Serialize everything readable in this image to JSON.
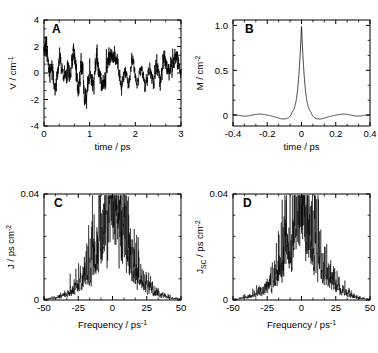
{
  "figure": {
    "background": "#ffffff",
    "line_color": "#000000",
    "panels": [
      "A",
      "B",
      "C",
      "D"
    ]
  },
  "chart_data": [
    {
      "type": "line",
      "panel": "A",
      "title": "",
      "label": "A",
      "xlabel": "time / ps",
      "ylabel": "V / cm-1",
      "ylabel_base": "V / cm",
      "ylabel_exp": "-1",
      "xlim": [
        0,
        3
      ],
      "ylim": [
        -4,
        4
      ],
      "xticks": [
        0,
        1,
        2,
        3
      ],
      "xticklabels": [
        "0",
        "1",
        "2",
        "3"
      ],
      "yticks": [
        -4,
        -2,
        0,
        2,
        4
      ],
      "yticklabels": [
        "-4",
        "-2",
        "0",
        "2",
        "4"
      ],
      "xminor_per_interval": 2,
      "yminor_per_interval": 2,
      "grid": false,
      "description": "Fluctuating solvent energy gap trajectory, high-frequency noise oscillating about zero, amplitude roughly -3.3 to 3.2 cm-1",
      "seed": 17,
      "n_points": 1500,
      "amplitude": 1.15,
      "series": [
        {
          "name": "V(t)",
          "envelope_note": "quasi-stationary noise, occasional excursions to +/-3"
        }
      ]
    },
    {
      "type": "line",
      "panel": "B",
      "label": "B",
      "xlabel": "time / ps",
      "ylabel": "M / cm-2",
      "ylabel_base": "M / cm",
      "ylabel_exp": "-2",
      "xlim": [
        -0.4,
        0.4
      ],
      "ylim": [
        -0.12,
        1.06
      ],
      "xticks": [
        -0.4,
        -0.2,
        0,
        0.2,
        0.4
      ],
      "xticklabels": [
        "-0.4",
        "-0.2",
        "0",
        "0.2",
        "0.4"
      ],
      "yticks": [
        0,
        0.5,
        1.0
      ],
      "yticklabels": [
        "0",
        "0.5",
        "1.0"
      ],
      "xminor_per_interval": 2,
      "yminor_per_interval": 2,
      "grid": false,
      "description": "Normalized autocorrelation function: sharp cusp peak of height 1.0 at t = 0, decaying with small negative sidelobes near -0.2 and 0.2 ps",
      "peak_value": 1.0,
      "peak_position": 0.0,
      "peak_halfwidth_ps": 0.022,
      "sidelobe_minima": [
        -0.22,
        0.2
      ],
      "sidelobe_depth": -0.06
    },
    {
      "type": "line",
      "panel": "C",
      "label": "C",
      "xlabel": "Frequency / ps-1",
      "xlabel_base": "Frequency / ps",
      "xlabel_exp": "-1",
      "ylabel": "J / ps cm-2",
      "ylabel_base": "J / ps cm",
      "ylabel_exp": "-2",
      "xlim": [
        -50,
        50
      ],
      "ylim": [
        0,
        0.04
      ],
      "xticks": [
        -50,
        -25,
        0,
        25,
        50
      ],
      "xticklabels": [
        "-50",
        "-25",
        "0",
        "25",
        "50"
      ],
      "yticks": [
        0,
        0.04
      ],
      "yticklabels": [
        "0",
        "0.04"
      ],
      "xminor_per_interval": 2,
      "yminor_per_interval": 4,
      "grid": false,
      "description": "Noisy spectral density peaked at zero frequency, dense spiky structure reaching ~0.038 near 0, broad wings decaying to near zero by +/-50 ps-1",
      "peak_value": 0.038,
      "peak_position": 0,
      "core_halfwidth": 12,
      "wing_halfwidth": 26,
      "seed": 5,
      "n_points": 900
    },
    {
      "type": "line",
      "panel": "D",
      "label": "D",
      "xlabel": "Frequency / ps-1",
      "xlabel_base": "Frequency / ps",
      "xlabel_exp": "-1",
      "ylabel": "Jsc / ps cm-2",
      "ylabel_base": "J",
      "ylabel_sub": "SC",
      "ylabel_tail": " / ps cm",
      "ylabel_exp": "-2",
      "xlim": [
        -50,
        50
      ],
      "ylim": [
        0,
        0.04
      ],
      "xticks": [
        -50,
        -25,
        0,
        25,
        50
      ],
      "xticklabels": [
        "-50",
        "-25",
        "0",
        "25",
        "50"
      ],
      "yticks": [
        0,
        0.04
      ],
      "yticklabels": [
        "0",
        "0.04"
      ],
      "xminor_per_interval": 2,
      "yminor_per_interval": 4,
      "grid": false,
      "description": "Semiclassically corrected spectral density, nearly identical to panel C: noisy peak at zero frequency reaching ~0.038 with broad wings",
      "peak_value": 0.038,
      "peak_position": 0,
      "core_halfwidth": 12,
      "wing_halfwidth": 26,
      "seed": 9,
      "n_points": 900
    }
  ]
}
